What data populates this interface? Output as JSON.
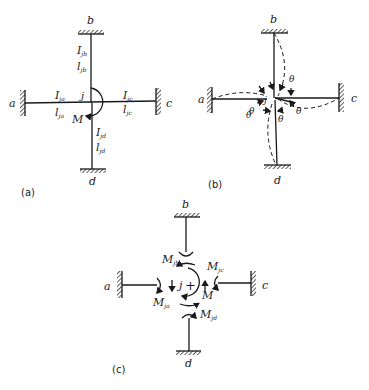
{
  "figure": {
    "panels": [
      {
        "id": "a",
        "caption": "(a)",
        "nodes": {
          "a": "a",
          "b": "b",
          "c": "c",
          "d": "d",
          "joint": "j"
        },
        "members": {
          "jb": {
            "I": "I",
            "I_sub": "jb",
            "l": "l",
            "l_sub": "jb"
          },
          "ja": {
            "I": "I",
            "I_sub": "ja",
            "l": "l",
            "l_sub": "ja"
          },
          "jc": {
            "I": "I",
            "I_sub": "jc",
            "l": "l",
            "l_sub": "jc"
          },
          "jd": {
            "I": "I",
            "I_sub": "jd",
            "l": "l",
            "l_sub": "jd"
          }
        },
        "moment_label": "M"
      },
      {
        "id": "b",
        "caption": "(b)",
        "nodes": {
          "a": "a",
          "b": "b",
          "c": "c",
          "d": "d",
          "joint": "j"
        },
        "rotation_label": "θ"
      },
      {
        "id": "c",
        "caption": "(c)",
        "nodes": {
          "a": "a",
          "b": "b",
          "c": "c",
          "d": "d",
          "joint": "j"
        },
        "plus": "+",
        "moments": {
          "jb": {
            "M": "M",
            "sub": "jb"
          },
          "jc": {
            "M": "M",
            "sub": "jc"
          },
          "ja": {
            "M": "M",
            "sub": "ja"
          },
          "jd": {
            "M": "M",
            "sub": "jd"
          },
          "applied": "M"
        }
      }
    ]
  }
}
